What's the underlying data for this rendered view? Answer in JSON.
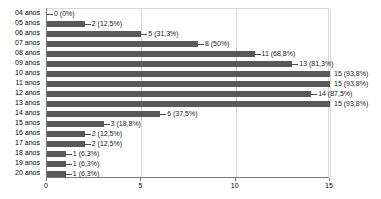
{
  "chart_data": {
    "type": "bar",
    "orientation": "horizontal",
    "title": "",
    "xlabel": "",
    "ylabel": "",
    "xlim": [
      0,
      15
    ],
    "xticks": [
      "0",
      "5",
      "10",
      "15"
    ],
    "xtick_values": [
      0,
      5,
      10,
      15
    ],
    "grid": true,
    "legend": null,
    "bar_color": "#595959",
    "categories": [
      "04 anos",
      "05 anos",
      "06 anos",
      "07 anos",
      "08 anos",
      "09 anos",
      "10 anos",
      "11 anos",
      "12 anos",
      "13 anos",
      "14 anos",
      "15 anos",
      "16 anos",
      "17 anos",
      "18 anos",
      "19 anos",
      "20 anos"
    ],
    "values": [
      0,
      2,
      5,
      8,
      11,
      13,
      15,
      15,
      14,
      15,
      6,
      3,
      2,
      2,
      1,
      1,
      1
    ],
    "percents": [
      "0%",
      "12,5%",
      "31,3%",
      "50%",
      "68,8%",
      "81,3%",
      "93,8%",
      "93,8%",
      "87,5%",
      "93,8%",
      "37,5%",
      "18,8%",
      "12,5%",
      "12,5%",
      "6,3%",
      "6,3%",
      "6,3%"
    ],
    "data_labels": [
      "0 (0%)",
      "2 (12,5%)",
      "5 (31,3%)",
      "8 (50%)",
      "11 (68,8%)",
      "13 (81,3%)",
      "15 (93,8%)",
      "15 (93,8%)",
      "14 (87,5%)",
      "15 (93,8%)",
      "6 (37,5%)",
      "3 (18,8%)",
      "2 (12,5%)",
      "2 (12,5%)",
      "1 (6,3%)",
      "1 (6,3%)",
      "1 (6,3%)"
    ]
  }
}
